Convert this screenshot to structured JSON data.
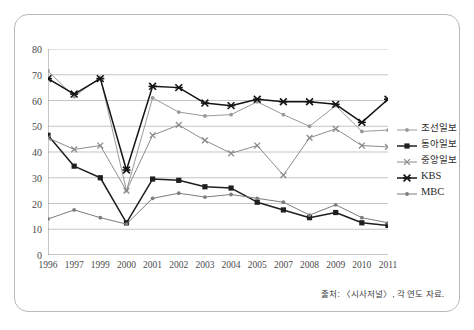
{
  "chart_data": {
    "type": "line",
    "title": "",
    "subtitle": "",
    "xlabel": "",
    "ylabel": "",
    "ylim": [
      0,
      80
    ],
    "ytick_step": 10,
    "yticks": [
      "0",
      "10",
      "20",
      "30",
      "40",
      "50",
      "60",
      "70",
      "80"
    ],
    "grid": "horizontal",
    "legend_position": "right",
    "categories": [
      "1996",
      "1997",
      "1999",
      "2000",
      "2001",
      "2002",
      "2003",
      "2004",
      "2005",
      "2007",
      "2008",
      "2009",
      "2010",
      "2011"
    ],
    "series": [
      {
        "name": "조선일보",
        "color": "#9a9a9a",
        "marker": "dot",
        "values": [
          71.5,
          61.5,
          69.0,
          25.0,
          61.0,
          55.5,
          54.0,
          54.5,
          59.5,
          54.5,
          50.0,
          58.0,
          48.0,
          48.5
        ]
      },
      {
        "name": "동아일보",
        "color": "#1f1f1f",
        "marker": "square",
        "values": [
          46.5,
          34.5,
          30.0,
          12.5,
          29.5,
          29.0,
          26.5,
          26.0,
          20.5,
          17.5,
          14.5,
          16.5,
          12.5,
          11.5
        ]
      },
      {
        "name": "중앙일보",
        "color": "#8c8c8c",
        "marker": "cross",
        "values": [
          45.5,
          41.0,
          42.5,
          25.0,
          46.5,
          50.5,
          44.5,
          39.5,
          42.5,
          31.0,
          45.5,
          49.0,
          42.5,
          42.0
        ]
      },
      {
        "name": "KBS",
        "color": "#141414",
        "marker": "star",
        "values": [
          68.5,
          62.5,
          68.5,
          33.0,
          65.5,
          65.0,
          59.0,
          58.0,
          60.5,
          59.5,
          59.5,
          58.5,
          51.5,
          60.5
        ]
      },
      {
        "name": "MBC",
        "color": "#7d7d7d",
        "marker": "dot",
        "values": [
          14.0,
          17.5,
          14.5,
          12.0,
          22.0,
          24.0,
          22.5,
          23.5,
          22.0,
          20.5,
          15.5,
          19.5,
          14.5,
          12.5
        ]
      }
    ]
  },
  "legend": {
    "items": [
      {
        "label": "조선일보",
        "script": "hangul"
      },
      {
        "label": "동아일보",
        "script": "hangul"
      },
      {
        "label": "중앙일보",
        "script": "hangul"
      },
      {
        "label": "KBS",
        "script": "latin"
      },
      {
        "label": "MBC",
        "script": "latin"
      }
    ]
  },
  "source_note": "출처: 〈시사저널〉, 각 연도 자료."
}
